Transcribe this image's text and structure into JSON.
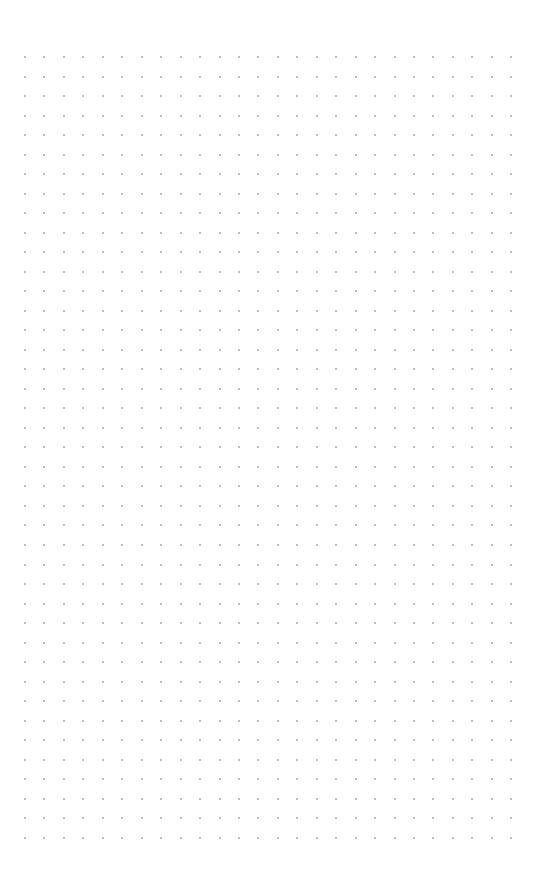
{
  "page": {
    "type": "dot-grid-paper",
    "background_color": "#ffffff",
    "dot_color": "#a8a8a8"
  },
  "grid": {
    "columns": 26,
    "rows": 41,
    "origin_x": 25,
    "origin_y": 57,
    "spacing_x": 19.45,
    "spacing_y": 19.52,
    "dot_size": 2
  }
}
